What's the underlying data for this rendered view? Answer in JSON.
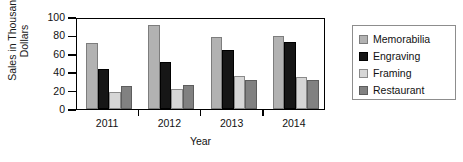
{
  "chart_data": {
    "type": "bar",
    "title": "",
    "xlabel": "Year",
    "ylabel": "Sales in Thousands of Dollars",
    "ylabel_line1": "Sales in Thousands of",
    "ylabel_line2": "Dollars",
    "categories": [
      "2011",
      "2012",
      "2013",
      "2014"
    ],
    "ylim": [
      0,
      100
    ],
    "yticks": [
      0,
      20,
      40,
      60,
      80,
      100
    ],
    "grid": false,
    "legend_position": "right",
    "series": [
      {
        "name": "Memorabilia",
        "color": "#b2b2b2",
        "values": [
          72,
          91,
          78,
          79
        ]
      },
      {
        "name": "Engraving",
        "color": "#161616",
        "values": [
          43,
          51,
          64,
          73
        ]
      },
      {
        "name": "Framing",
        "color": "#d6d6d6",
        "values": [
          19,
          22,
          36,
          35
        ]
      },
      {
        "name": "Restaurant",
        "color": "#818181",
        "values": [
          25,
          26,
          32,
          31
        ]
      }
    ]
  }
}
